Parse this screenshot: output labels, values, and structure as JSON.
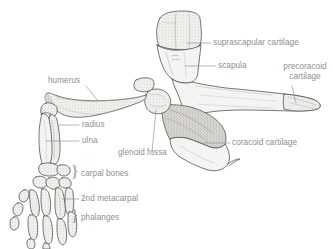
{
  "figure": {
    "type": "anatomical-illustration",
    "background_color": "#ffffff",
    "ink_color": "#4a4a4a",
    "label_color": "#8e8e8e",
    "bone_fill": "#f2f1ee",
    "cartilage_fill": "#d8d6d0"
  },
  "labels": {
    "suprascapular_cartilage": "suprascapular cartilage",
    "scapula": "scapula",
    "precoracoid_cartilage_line1": "precoracoid",
    "precoracoid_cartilage_line2": "cartilage",
    "coracoid_cartilage": "coracoid cartilage",
    "glenoid_fossa": "glenoid fossa",
    "humerus": "humerus",
    "radius": "radius",
    "ulna": "ulna",
    "carpal_bones": "carpal bones",
    "second_metacarpal": "2nd metacarpal",
    "phalanges": "phalanges"
  },
  "braces": {
    "carpal": "}",
    "phalanges": "}"
  }
}
